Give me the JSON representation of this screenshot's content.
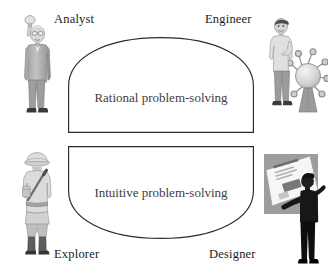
{
  "diagram": {
    "background_color": "#ffffff",
    "outline_color": "#2a2a2a",
    "label_color": "#1b1b1b",
    "shape_text_color": "#3d3d3d",
    "zones": [
      {
        "id": "rational",
        "label": "Rational problem-solving",
        "shape": "dome-up"
      },
      {
        "id": "intuitive",
        "label": "Intuitive problem-solving",
        "shape": "dome-down"
      }
    ],
    "roles": [
      {
        "id": "analyst",
        "label": "Analyst",
        "position": "top-left",
        "figure": "man-in-suit-holding-glass-figure"
      },
      {
        "id": "engineer",
        "label": "Engineer",
        "position": "top-right",
        "figure": "man-with-machine-apparatus-figure"
      },
      {
        "id": "explorer",
        "label": "Explorer",
        "position": "bottom-left",
        "figure": "explorer-with-pith-helmet-and-backpack-figure"
      },
      {
        "id": "designer",
        "label": "Designer",
        "position": "bottom-right",
        "figure": "person-presenting-board-figure"
      }
    ]
  }
}
